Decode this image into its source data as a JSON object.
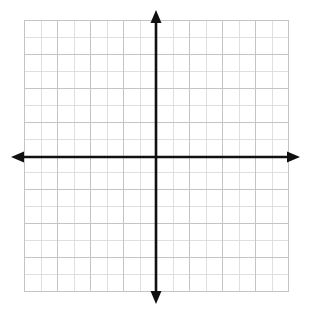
{
  "figure": {
    "title": "",
    "kind": "blank-coordinate-grid",
    "background_color": "#ffffff",
    "width": 309,
    "height": 315
  },
  "chart_data": {
    "type": "scatter",
    "title": "",
    "subtitle": "",
    "xlabel": "",
    "ylabel": "",
    "series": [
      {
        "name": "",
        "x": [],
        "y": []
      }
    ],
    "annotations": [],
    "legend": {
      "entries": [],
      "position": "none",
      "visible": false
    },
    "grid": {
      "visible": true,
      "columns": 16,
      "rows": 16,
      "cell_px": 16.5,
      "minor_color": "#dcdcdc",
      "major_color": "#c4c4c4",
      "major_every": 2
    },
    "axes": {
      "x_axis": {
        "visible": true,
        "color": "#101010",
        "arrow_start": true,
        "arrow_end": true,
        "tick_labels": [],
        "range": [
          -8,
          8
        ]
      },
      "y_axis": {
        "visible": true,
        "color": "#101010",
        "arrow_start": true,
        "arrow_end": true,
        "tick_labels": [],
        "range": [
          -8,
          8
        ]
      },
      "origin_label": "",
      "origin_x": 156,
      "origin_y": 157
    },
    "xlim": [
      -8,
      8
    ],
    "ylim": [
      -8,
      8
    ],
    "tick_marks_visible": false,
    "numbers_visible": false
  },
  "geometry": {
    "grid_left": 24,
    "grid_top": 20,
    "grid_right": 288,
    "grid_bottom": 291,
    "x_axis_y": 157,
    "y_axis_x": 156,
    "x_arrow_left_tip": 11,
    "x_arrow_right_tip": 300,
    "y_arrow_top_tip": 10,
    "y_arrow_bottom_tip": 304,
    "axis_stroke_width": 2.6,
    "arrow_half_width": 5.5,
    "arrow_length": 13
  },
  "colors": {
    "axis": "#101010",
    "grid_minor": "#dcdcdc",
    "grid_major": "#c2c2c2",
    "background": "#ffffff"
  }
}
